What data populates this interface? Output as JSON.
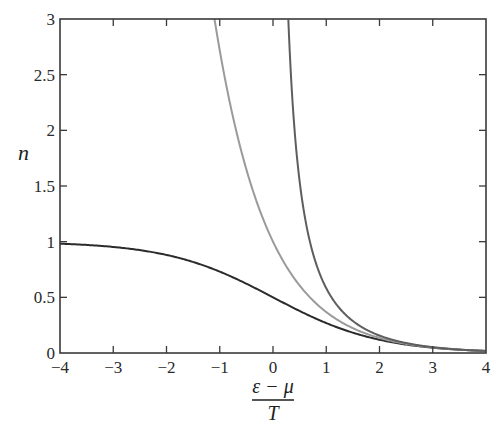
{
  "chart_data": {
    "type": "line",
    "title": "",
    "xlabel": "(ε − μ) / T",
    "xlabel_numerator": "ε − μ",
    "xlabel_denominator": "T",
    "ylabel": "n",
    "xlim": [
      -4,
      4
    ],
    "ylim": [
      0,
      3
    ],
    "grid": false,
    "legend": "none",
    "x_ticks": [
      -4,
      -3,
      -2,
      -1,
      0,
      1,
      2,
      3,
      4
    ],
    "x_tick_labels": [
      "−4",
      "−3",
      "−2",
      "−1",
      "0",
      "1",
      "2",
      "3",
      "4"
    ],
    "y_ticks": [
      0,
      0.5,
      1,
      1.5,
      2,
      2.5,
      3
    ],
    "y_tick_labels": [
      "0",
      "0.5",
      "1",
      "1.5",
      "2",
      "2.5",
      "3"
    ],
    "series": [
      {
        "name": "Fermi-Dirac",
        "formula": "1/(exp(x)+1)",
        "color": "#2b2b2b",
        "x": [
          -4,
          -3,
          -2,
          -1,
          0,
          1,
          2,
          3,
          4
        ],
        "values": [
          0.982,
          0.953,
          0.881,
          0.731,
          0.5,
          0.269,
          0.119,
          0.047,
          0.018
        ]
      },
      {
        "name": "Boltzmann",
        "formula": "exp(-x)",
        "color": "#9a9a9a",
        "x": [
          -1.1,
          -1,
          -0.5,
          0,
          0.5,
          1,
          2,
          3,
          4
        ],
        "values": [
          3.0,
          2.718,
          1.649,
          1.0,
          0.607,
          0.368,
          0.135,
          0.05,
          0.018
        ]
      },
      {
        "name": "Bose-Einstein",
        "formula": "1/(exp(x)-1)",
        "color": "#5e5e5e",
        "x": [
          0.288,
          0.5,
          1,
          1.5,
          2,
          3,
          4
        ],
        "values": [
          3.0,
          1.541,
          0.582,
          0.287,
          0.157,
          0.052,
          0.019
        ]
      }
    ]
  }
}
